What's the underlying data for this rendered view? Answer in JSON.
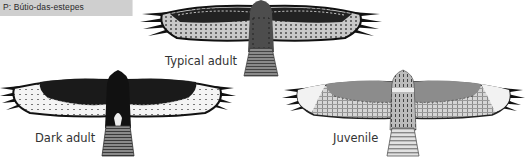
{
  "header": {
    "label": "P: Bútio-das-estepes"
  },
  "birds": [
    {
      "id": "typical",
      "caption": "Typical adult",
      "colors": {
        "wing_lining": "#b8b8b8",
        "coverts": "#2a2a2a",
        "body": "#555555",
        "tail": "#777777"
      }
    },
    {
      "id": "dark",
      "caption": "Dark adult",
      "colors": {
        "wing_lining": "#1a1a1a",
        "flight": "#f2f2f2",
        "body": "#151515",
        "tail": "#666666"
      }
    },
    {
      "id": "juvenile",
      "caption": "Juvenile",
      "colors": {
        "wing_lining": "#8a8a8a",
        "flight": "#dcdcdc",
        "body": "#9a9a9a",
        "tail": "#c8c8c8"
      }
    }
  ]
}
